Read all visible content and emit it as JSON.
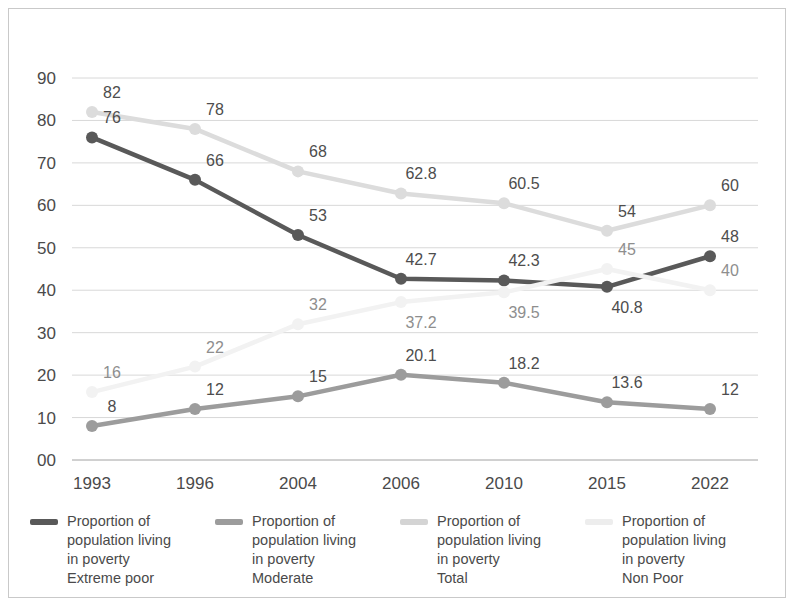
{
  "chart_data": {
    "type": "line",
    "title": "",
    "xlabel": "",
    "ylabel": "",
    "categories": [
      "1993",
      "1996",
      "2004",
      "2006",
      "2010",
      "2015",
      "2022"
    ],
    "ylim": [
      0,
      90
    ],
    "yticks": [
      "00",
      "10",
      "20",
      "30",
      "40",
      "50",
      "60",
      "70",
      "80",
      "90"
    ],
    "ytick_values": [
      0,
      10,
      20,
      30,
      40,
      50,
      60,
      70,
      80,
      90
    ],
    "grid": true,
    "legend_position": "bottom",
    "series": [
      {
        "name": "Proportion of\npopulation living\nin poverty\nExtreme poor",
        "short_name": "Extreme poor",
        "color": "#595959",
        "values": [
          76,
          66,
          53,
          42.7,
          42.3,
          40.8,
          48
        ],
        "labels": [
          "76",
          "66",
          "53",
          "42.7",
          "42.3",
          "40.8",
          "48"
        ],
        "label_side": [
          "above",
          "above",
          "above",
          "above",
          "above",
          "below",
          "above"
        ]
      },
      {
        "name": "Proportion of\npopulation living\nin poverty\nModerate",
        "short_name": "Moderate",
        "color": "#9c9c9c",
        "values": [
          8,
          12,
          15,
          20.1,
          18.2,
          13.6,
          12
        ],
        "labels": [
          "8",
          "12",
          "15",
          "20.1",
          "18.2",
          "13.6",
          "12"
        ],
        "label_side": [
          "above",
          "above",
          "above",
          "above",
          "above",
          "above",
          "above"
        ]
      },
      {
        "name": "Proportion of\npopulation living\nin poverty\nTotal",
        "short_name": "Total",
        "color": "#f2f2f2",
        "values": [
          16,
          22,
          32,
          37.2,
          39.5,
          45,
          40
        ],
        "labels": [
          "16",
          "22",
          "32",
          "37.2",
          "39.5",
          "45",
          "40"
        ],
        "label_side": [
          "above",
          "above",
          "above",
          "below",
          "below",
          "above",
          "above"
        ]
      },
      {
        "name": "Proportion of\npopulation living\nin poverty\nNon Poor",
        "short_name": "Non Poor",
        "color": "#dcdcdc",
        "values": [
          82,
          78,
          68,
          62.8,
          60.5,
          54,
          60
        ],
        "labels": [
          "82",
          "78",
          "68",
          "62.8",
          "60.5",
          "54",
          "60"
        ],
        "label_side": [
          "above",
          "above",
          "above",
          "above",
          "above",
          "above",
          "above"
        ]
      }
    ]
  },
  "legend": {
    "items": [
      {
        "label": "Proportion of\npopulation living\nin poverty\nExtreme poor",
        "color": "#595959"
      },
      {
        "label": "Proportion of\npopulation living\nin poverty\nModerate",
        "color": "#9c9c9c"
      },
      {
        "label": "Proportion of\npopulation living\nin poverty\nTotal",
        "color": "#d4d4d4"
      },
      {
        "label": "Proportion of\npopulation living\nin poverty\nNon Poor",
        "color": "#ededed"
      }
    ]
  }
}
